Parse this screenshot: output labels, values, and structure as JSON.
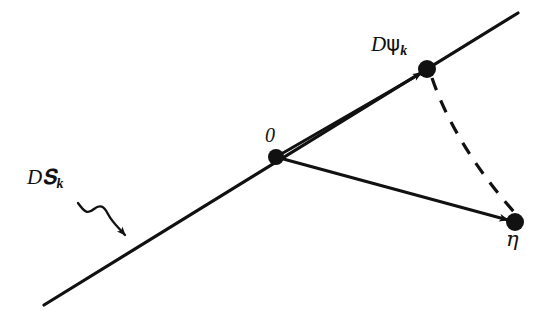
{
  "figure": {
    "type": "vector-diagram",
    "background_color": "#ffffff",
    "stroke_color": "#111111",
    "labels": {
      "tangent_space": {
        "prefix": "D",
        "symbol": "𝐒",
        "symbol_plain": "K",
        "subscript": "k",
        "full_text": "DK_k"
      },
      "psi_point": {
        "prefix": "D",
        "symbol": "ψ",
        "subscript": "k",
        "full_text": "Dψ_k"
      },
      "origin": {
        "full_text": "0"
      },
      "eta_point": {
        "symbol": "η",
        "full_text": "η"
      }
    },
    "nodes": [
      {
        "name": "origin",
        "x": 276,
        "y": 157,
        "radius": 8,
        "label": "0"
      },
      {
        "name": "psi",
        "x": 427,
        "y": 69,
        "radius": 9,
        "label": "Dψ_k"
      },
      {
        "name": "eta",
        "x": 515,
        "y": 222,
        "radius": 9,
        "label": "η"
      }
    ],
    "edges": [
      {
        "name": "manifold-line",
        "style": "solid",
        "from": [
          44,
          305
        ],
        "to": [
          518,
          13
        ],
        "arrow": false
      },
      {
        "name": "origin-to-psi-vector",
        "style": "solid",
        "from": [
          276,
          157
        ],
        "to": [
          427,
          69
        ],
        "arrow": true
      },
      {
        "name": "origin-to-eta-vector",
        "style": "solid",
        "from": [
          276,
          157
        ],
        "to": [
          515,
          222
        ],
        "arrow": true
      },
      {
        "name": "psi-to-eta-geodesic",
        "style": "dashed",
        "from": [
          427,
          69
        ],
        "to": [
          515,
          222
        ],
        "arrow": false
      }
    ],
    "pointer": {
      "name": "squiggly-pointer-arrow",
      "style": "wavy",
      "from": [
        78,
        203
      ],
      "to": [
        133,
        244
      ],
      "arrow": true
    }
  }
}
